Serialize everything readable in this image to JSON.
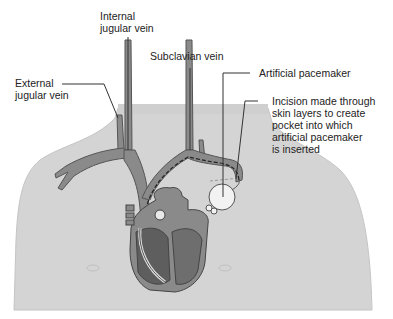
{
  "figure": {
    "labels": {
      "internal_jugular": {
        "line1": "Internal",
        "line2": "jugular vein"
      },
      "external_jugular": {
        "line1": "External",
        "line2": "jugular vein"
      },
      "subclavian": {
        "line1": "Subclavian vein"
      },
      "pacemaker": {
        "line1": "Artificial pacemaker"
      },
      "incision": {
        "line1": "Incision made through",
        "line2": "skin layers to create",
        "line3": "pocket into which",
        "line4": "artificial pacemaker",
        "line5": "is inserted"
      }
    },
    "colors": {
      "body": "#d4d4d4",
      "vein": "#8a8a8a",
      "vein_outline": "#555555",
      "heart_dark": "#6e6e6e",
      "pacemaker": "#f2f2f2",
      "text": "#222222",
      "leader_line": "#333333"
    }
  }
}
